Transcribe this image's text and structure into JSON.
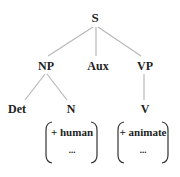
{
  "diagram": {
    "type": "syntax-tree",
    "nodes": {
      "root": "S",
      "np": "NP",
      "aux": "Aux",
      "vp": "VP",
      "det": "Det",
      "n": "N",
      "v": "V"
    },
    "features": {
      "n": {
        "feature": "+ human",
        "more": "..."
      },
      "v": {
        "feature": "+ animate",
        "more": "..."
      }
    },
    "edges": [
      [
        "S",
        "NP"
      ],
      [
        "S",
        "Aux"
      ],
      [
        "S",
        "VP"
      ],
      [
        "NP",
        "Det"
      ],
      [
        "NP",
        "N"
      ],
      [
        "VP",
        "V"
      ]
    ]
  }
}
